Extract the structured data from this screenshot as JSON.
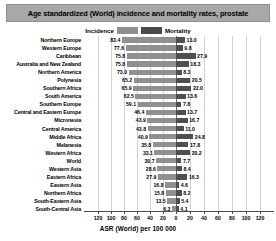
{
  "title": "Age standardized (World) incidence and mortality rates, prostate",
  "legend": {
    "incidence_label": "Incidence",
    "mortality_label": "Mortality",
    "incidence_color": "#909090",
    "mortality_color": "#4f4f4f"
  },
  "axis": {
    "title": "ASR (World) per 100 000",
    "ticks_left": [
      "120",
      "100",
      "80",
      "60",
      "40",
      "20"
    ],
    "tick_center": "0",
    "ticks_right": [
      "20",
      "40",
      "60",
      "80",
      "100",
      "120"
    ],
    "max": 120
  },
  "chart_data": {
    "type": "bar",
    "orientation": "horizontal",
    "layout": "diverging-back-to-back",
    "title": "Age standardized (World) incidence and mortality rates, prostate",
    "xlabel": "ASR (World) per 100 000",
    "ylabel": "",
    "xlim": [
      0,
      120
    ],
    "grid": true,
    "legend_position": "top-center",
    "categories": [
      "Northern Europe",
      "Western Europe",
      "Caribbean",
      "Australia and New Zealand",
      "Northern America",
      "Polynesia",
      "Southern Africa",
      "South America",
      "Southern Europe",
      "Central and Eastern Europe",
      "Micronesia",
      "Central America",
      "Middle Africa",
      "Melanesia",
      "Western Africa",
      "World",
      "Western Asia",
      "Eastern Africa",
      "Eastern Asia",
      "Northern Africa",
      "South-Eastern Asia",
      "South-Central Asia"
    ],
    "series": [
      {
        "name": "Incidence",
        "direction": "left",
        "values": [
          83.4,
          77.6,
          75.8,
          75.8,
          73.0,
          65.2,
          65.9,
          62.5,
          59.1,
          46.4,
          43.9,
          43.8,
          40.9,
          35.8,
          33.1,
          30.7,
          28.6,
          27.9,
          16.8,
          15.8,
          13.5,
          6.3
        ]
      },
      {
        "name": "Mortality",
        "direction": "right",
        "values": [
          13.0,
          9.8,
          27.9,
          18.3,
          8.3,
          20.5,
          22.0,
          13.6,
          7.8,
          13.7,
          16.7,
          11.0,
          24.8,
          17.8,
          20.2,
          7.7,
          8.4,
          16.3,
          4.6,
          8.2,
          5.4,
          4.1
        ]
      }
    ]
  }
}
